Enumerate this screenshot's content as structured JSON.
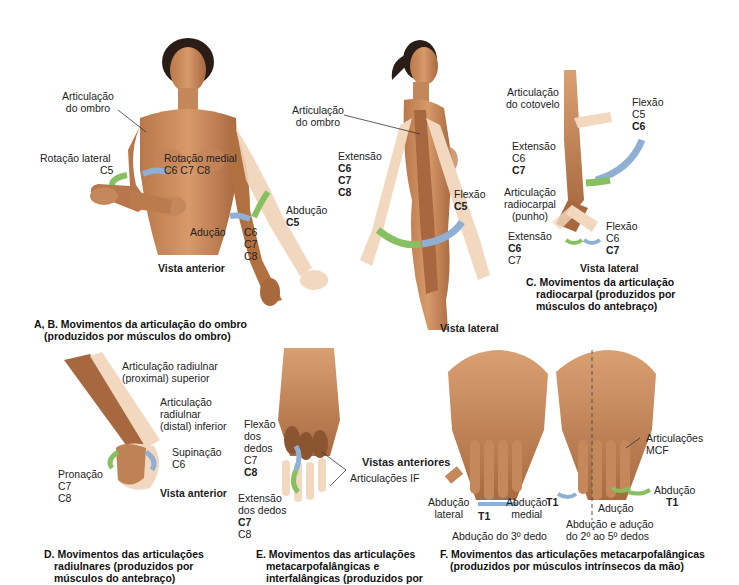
{
  "colors": {
    "skin_light": "#e7b98f",
    "skin_mid": "#c98a5a",
    "skin_dark": "#8c5532",
    "skin_ghost": "#f3dcc4",
    "arrow_green": "#86c061",
    "arrow_blue": "#8fb0d4",
    "hair": "#2a1d17",
    "text": "#222222"
  },
  "panel_ab": {
    "anterior": {
      "labels": {
        "shoulder_joint_left": [
          "Articulação",
          "do ombro"
        ],
        "lateral_rotation": "Rotação lateral",
        "lateral_rotation_nerve": "C5",
        "medial_rotation": "Rotação medial",
        "medial_rotation_nerves": "C6 C7 C8",
        "adduction": "Adução",
        "adduction_nerves": [
          "C6",
          "C7",
          "C8"
        ],
        "abduction": "Abdução",
        "abduction_nerve": "C5",
        "view": "Vista anterior"
      }
    },
    "lateral": {
      "labels": {
        "shoulder_joint": [
          "Articulação",
          "do ombro"
        ],
        "extension": "Extensão",
        "extension_nerves": [
          "C6",
          "C7",
          "C8"
        ],
        "flexion": "Flexão",
        "flexion_nerve": "C5",
        "view": "Vista lateral"
      }
    },
    "caption": [
      "A, B. Movimentos da articulação do ombro",
      "(produzidos por músculos do ombro)"
    ]
  },
  "panel_c": {
    "labels": {
      "elbow_joint": [
        "Articulação",
        "do cotovelo"
      ],
      "flexion_top": "Flexão",
      "flexion_top_nerves": [
        "C5",
        "C6"
      ],
      "extension_top": "Extensão",
      "extension_top_nerves": [
        "C6",
        "C7"
      ],
      "radiocarpal_joint": [
        "Articulação",
        "radiocarpal",
        "(punho)"
      ],
      "flexion_wrist": "Flexão",
      "flexion_wrist_nerves": [
        "C6",
        "C7"
      ],
      "extension_wrist": "Extensão",
      "extension_wrist_nerves": [
        "C6",
        "C7"
      ],
      "view": "Vista lateral"
    },
    "caption": [
      "C. Movimentos da articulação",
      "radiocarpal (produzidos por",
      "músculos do antebraço)"
    ]
  },
  "panel_d": {
    "labels": {
      "radioulnar_proximal": [
        "Articulação radiulnar",
        "(proximal) superior"
      ],
      "radioulnar_distal": [
        "Articulação",
        "radiulnar",
        "(distal) inferior"
      ],
      "supination": "Supinação",
      "supination_nerve": "C6",
      "pronation": "Pronação",
      "pronation_nerves": [
        "C7",
        "C8"
      ],
      "view": "Vista anterior"
    },
    "caption": [
      "D. Movimentos das articulações",
      "radiulnares (produzidos por",
      "músculos do antebraço)"
    ]
  },
  "panel_e": {
    "labels": {
      "finger_flexion": [
        "Flexão",
        "dos",
        "dedos"
      ],
      "finger_flexion_nerves": [
        "C7",
        "C8"
      ],
      "finger_extension": [
        "Extensão",
        "dos dedos"
      ],
      "finger_extension_nerves": [
        "C7",
        "C8"
      ],
      "if_joints": "Articulações IF"
    },
    "caption": [
      "E. Movimentos das articulações",
      "metacarpofalângicas e",
      "interfalângicas (produzidos por"
    ]
  },
  "panel_f": {
    "labels": {
      "anterior_views": "Vistas anteriores",
      "lateral_abduction": [
        "Abdução",
        "lateral"
      ],
      "medial_abduction": [
        "Abdução",
        "medial"
      ],
      "t1_left": "T1",
      "third_finger_abduction": "Abdução do 3º dedo",
      "mcp_joints": [
        "Articulações",
        "MCF"
      ],
      "abduction": "Abdução",
      "t1_right_top": "T1",
      "t1_right_left": "T1",
      "adduction": "Adução",
      "abd_add_2_5": [
        "Abdução e adução",
        "do 2º ao 5º dedos"
      ]
    },
    "caption": [
      "F. Movimentos das articulações metacarpofalângicas",
      "(produzidos por músculos intrínsecos da mão)"
    ]
  }
}
